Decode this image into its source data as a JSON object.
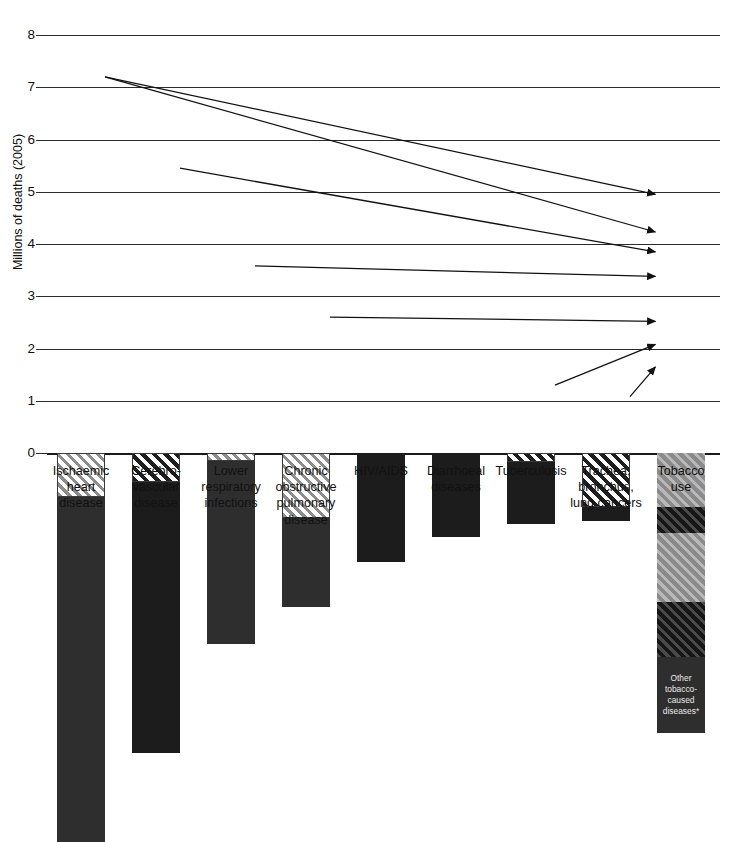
{
  "chart_data": {
    "type": "bar",
    "title": "",
    "xlabel": "",
    "ylabel": "Millions of deaths (2005)",
    "ylim": [
      0,
      8
    ],
    "ytick_labels": [
      "0",
      "1",
      "2",
      "3",
      "4",
      "5",
      "6",
      "7",
      "8"
    ],
    "ytick_values": [
      0,
      1,
      2,
      3,
      4,
      5,
      6,
      7,
      8
    ],
    "grid": true,
    "legend": "none",
    "stacked": true,
    "categories": [
      "Ischaemic heart disease",
      "Cerebrovascular disease",
      "Lower respiratory infections",
      "Chronic obstructive pulmonary disease",
      "HIV/AIDS",
      "Diarrhoeal diseases",
      "Tuberculosis",
      "Trachea, bronchus, lung cancers",
      "Tobacco use"
    ],
    "category_label_lines": [
      [
        "Ischaemic",
        "heart",
        "disease"
      ],
      [
        "Cerebro-",
        "vascular",
        "disease"
      ],
      [
        "Lower",
        "respiratory",
        "infections"
      ],
      [
        "Chronic",
        "obstructive",
        "pulmonary",
        "disease"
      ],
      [
        "HIV/AIDS"
      ],
      [
        "Diarrhoeal",
        "diseases"
      ],
      [
        "Tuberculosis"
      ],
      [
        "Trachea,",
        "bronchus,",
        "lung cancers"
      ],
      [
        "Tobacco",
        "use"
      ]
    ],
    "totals": [
      7.45,
      5.75,
      3.65,
      2.95,
      2.08,
      1.6,
      1.35,
      1.3,
      5.35
    ],
    "bars": [
      {
        "category": "Ischaemic heart disease",
        "total": 7.45,
        "segments": [
          {
            "name": "non-tobacco deaths",
            "from": 0,
            "to": 6.6,
            "fill": "dark"
          },
          {
            "name": "tobacco-attributable deaths",
            "from": 6.6,
            "to": 7.45,
            "fill": "lighthatch"
          }
        ]
      },
      {
        "category": "Cerebrovascular disease",
        "total": 5.75,
        "segments": [
          {
            "name": "non-tobacco deaths",
            "from": 0,
            "to": 5.2,
            "fill": "black"
          },
          {
            "name": "tobacco-attributable deaths",
            "from": 5.2,
            "to": 5.75,
            "fill": "darkhatch"
          }
        ]
      },
      {
        "category": "Lower respiratory infections",
        "total": 3.65,
        "segments": [
          {
            "name": "non-tobacco deaths",
            "from": 0,
            "to": 3.5,
            "fill": "dark"
          },
          {
            "name": "tobacco-attributable deaths",
            "from": 3.5,
            "to": 3.65,
            "fill": "lighthatch"
          }
        ]
      },
      {
        "category": "Chronic obstructive pulmonary disease",
        "total": 2.95,
        "segments": [
          {
            "name": "non-tobacco deaths",
            "from": 0,
            "to": 1.7,
            "fill": "dark"
          },
          {
            "name": "tobacco-attributable deaths",
            "from": 1.7,
            "to": 2.95,
            "fill": "lighthatch"
          }
        ]
      },
      {
        "category": "HIV/AIDS",
        "total": 2.08,
        "segments": [
          {
            "name": "deaths",
            "from": 0,
            "to": 2.08,
            "fill": "black"
          }
        ]
      },
      {
        "category": "Diarrhoeal diseases",
        "total": 1.6,
        "segments": [
          {
            "name": "deaths",
            "from": 0,
            "to": 1.6,
            "fill": "black"
          }
        ]
      },
      {
        "category": "Tuberculosis",
        "total": 1.35,
        "segments": [
          {
            "name": "non-tobacco deaths",
            "from": 0,
            "to": 1.18,
            "fill": "black"
          },
          {
            "name": "tobacco-attributable deaths",
            "from": 1.18,
            "to": 1.35,
            "fill": "darkhatch"
          }
        ]
      },
      {
        "category": "Trachea, bronchus, lung cancers",
        "total": 1.3,
        "segments": [
          {
            "name": "non-tobacco deaths",
            "from": 0,
            "to": 0.26,
            "fill": "black"
          },
          {
            "name": "tobacco-attributable deaths",
            "from": 0.26,
            "to": 1.3,
            "fill": "darkhatch"
          }
        ]
      },
      {
        "category": "Tobacco use",
        "total": 5.35,
        "segments": [
          {
            "name": "other tobacco-caused diseases",
            "from": 0,
            "to": 1.45,
            "fill": "dark",
            "note": "Other tobacco-caused diseases*"
          },
          {
            "name": "trachea bronchus lung cancers share",
            "from": 1.45,
            "to": 2.5,
            "fill": "blackhatch"
          },
          {
            "name": "lower respiratory and copd share",
            "from": 2.5,
            "to": 3.82,
            "fill": "greyhatch"
          },
          {
            "name": "cerebrovascular share",
            "from": 3.82,
            "to": 4.32,
            "fill": "blackhatch"
          },
          {
            "name": "ischaemic heart share",
            "from": 4.32,
            "to": 5.35,
            "fill": "greyhatch"
          }
        ]
      }
    ],
    "annotations": {
      "in_bar_note": "Other tobacco-caused diseases*",
      "arrows": [
        {
          "from_category": "Ischaemic heart disease",
          "to_category": "Tobacco use",
          "from_value": 7.2,
          "to_value": 4.95
        },
        {
          "from_category": "Ischaemic heart disease",
          "to_category": "Tobacco use",
          "from_value": 7.2,
          "to_value": 4.23
        },
        {
          "from_category": "Cerebrovascular disease",
          "to_category": "Tobacco use",
          "from_value": 5.45,
          "to_value": 3.85
        },
        {
          "from_category": "Lower respiratory infections",
          "to_category": "Tobacco use",
          "from_value": 3.58,
          "to_value": 3.38
        },
        {
          "from_category": "Chronic obstructive pulmonary disease",
          "to_category": "Tobacco use",
          "from_value": 2.6,
          "to_value": 2.52
        },
        {
          "from_category": "Tuberculosis",
          "to_category": "Tobacco use",
          "from_value": 1.3,
          "to_value": 2.08
        },
        {
          "from_category": "Trachea, bronchus, lung cancers",
          "to_category": "Tobacco use",
          "from_value": 1.08,
          "to_value": 1.65
        }
      ]
    }
  }
}
